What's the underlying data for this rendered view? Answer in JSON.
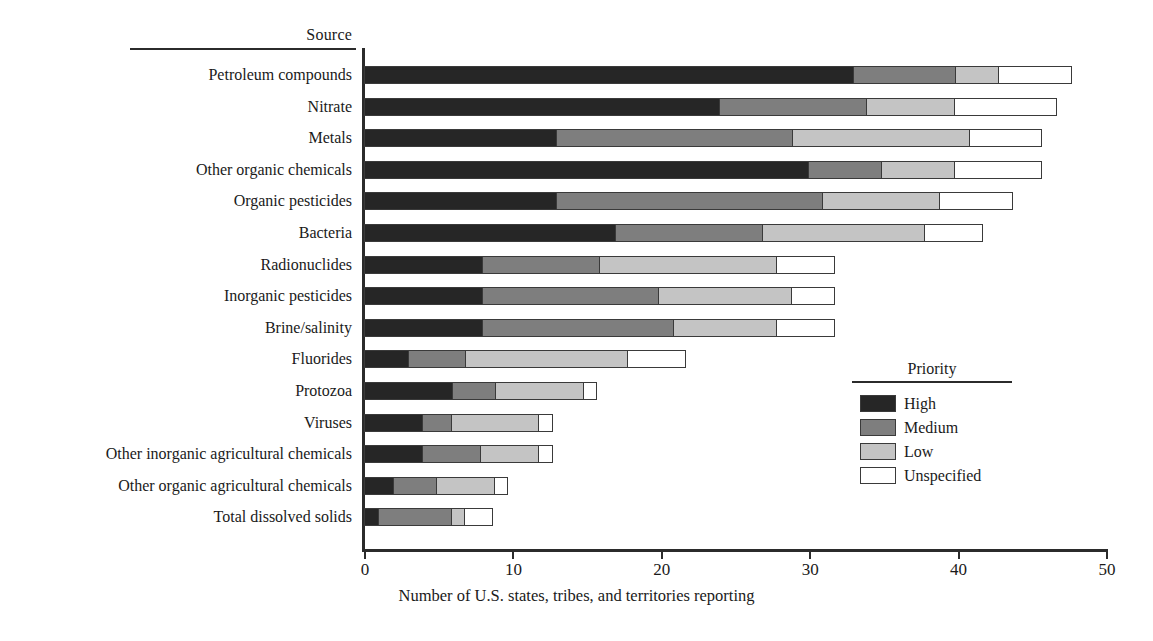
{
  "header": {
    "source_label": "Source"
  },
  "chart_data": {
    "type": "bar",
    "orientation": "horizontal",
    "stacked": true,
    "title": "",
    "xlabel": "Number of U.S. states, tribes, and territories reporting",
    "ylabel": "Source",
    "xlim": [
      0,
      50
    ],
    "xticks": [
      0,
      10,
      20,
      30,
      40,
      50
    ],
    "xtick_labels": [
      "0",
      "10",
      "20",
      "30",
      "40",
      "50"
    ],
    "grid": false,
    "legend_title": "Priority",
    "legend_position": "right-inside",
    "categories": [
      "Petroleum compounds",
      "Nitrate",
      "Metals",
      "Other organic chemicals",
      "Organic pesticides",
      "Bacteria",
      "Radionuclides",
      "Inorganic pesticides",
      "Brine/salinity",
      "Fluorides",
      "Protozoa",
      "Viruses",
      "Other inorganic agricultural chemicals",
      "Other organic agricultural chemicals",
      "Total dissolved solids"
    ],
    "series": [
      {
        "name": "High",
        "color": "#262626",
        "values": [
          33,
          24,
          13,
          30,
          13,
          17,
          8,
          8,
          8,
          3,
          6,
          4,
          4,
          2,
          1
        ]
      },
      {
        "name": "Medium",
        "color": "#7e7e7e",
        "values": [
          7,
          10,
          16,
          5,
          18,
          10,
          8,
          12,
          13,
          4,
          3,
          2,
          4,
          3,
          5
        ]
      },
      {
        "name": "Low",
        "color": "#c4c4c4",
        "values": [
          3,
          6,
          12,
          5,
          8,
          11,
          12,
          9,
          7,
          11,
          6,
          6,
          4,
          4,
          1
        ]
      },
      {
        "name": "Unspecified",
        "color": "#ffffff",
        "values": [
          5,
          7,
          5,
          6,
          5,
          4,
          4,
          3,
          4,
          4,
          1,
          1,
          1,
          1,
          2
        ]
      }
    ],
    "totals": [
      48,
      47,
      46,
      46,
      44,
      42,
      32,
      32,
      32,
      22,
      16,
      13,
      13,
      10,
      9
    ]
  },
  "legend": {
    "title": "Priority",
    "items": [
      {
        "label": "High",
        "key": "high"
      },
      {
        "label": "Medium",
        "key": "medium"
      },
      {
        "label": "Low",
        "key": "low"
      },
      {
        "label": "Unspecified",
        "key": "unspecified"
      }
    ]
  }
}
